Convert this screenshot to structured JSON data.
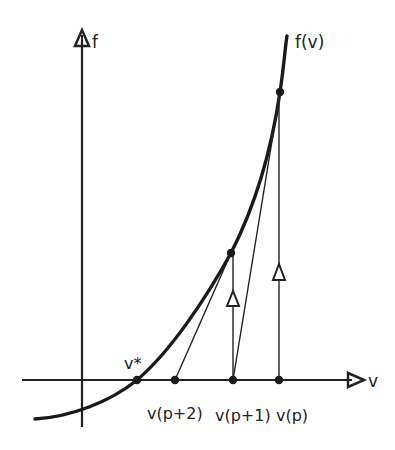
{
  "diagram": {
    "axes": {
      "y_label": "f",
      "x_label": "v"
    },
    "curve": {
      "label": "f(v)"
    },
    "points": {
      "root": "v*",
      "iterates": [
        {
          "label": "v(p+2)"
        },
        {
          "label": "v(p+1)"
        },
        {
          "label": "v(p)"
        }
      ]
    },
    "colors": {
      "ink": "#222222",
      "background": "#ffffff"
    }
  }
}
